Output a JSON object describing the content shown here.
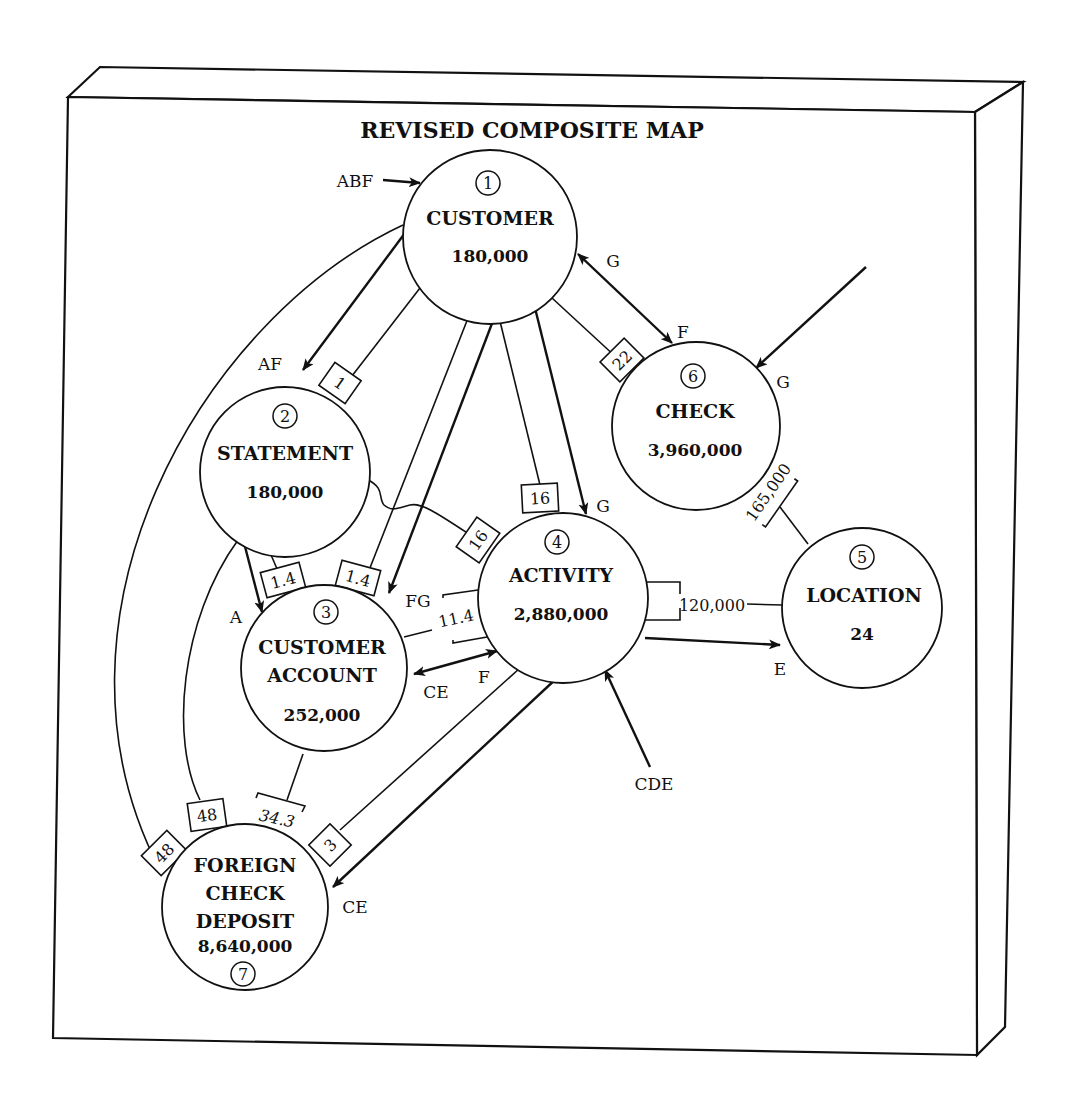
{
  "title": "REVISED COMPOSITE MAP",
  "nodes": [
    {
      "id": 1,
      "num": "1",
      "name": "CUSTOMER",
      "volume": "180,000"
    },
    {
      "id": 2,
      "num": "2",
      "name": "STATEMENT",
      "volume": "180,000"
    },
    {
      "id": 3,
      "num": "3",
      "name_line1": "CUSTOMER",
      "name_line2": "ACCOUNT",
      "volume": "252,000"
    },
    {
      "id": 4,
      "num": "4",
      "name": "ACTIVITY",
      "volume": "2,880,000"
    },
    {
      "id": 5,
      "num": "5",
      "name": "LOCATION",
      "volume": "24"
    },
    {
      "id": 6,
      "num": "6",
      "name": "CHECK",
      "volume": "3,960,000"
    },
    {
      "id": 7,
      "num": "7",
      "name_line1": "FOREIGN",
      "name_line2": "CHECK",
      "name_line3": "DEPOSIT",
      "volume": "8,640,000"
    }
  ],
  "ratios": {
    "customer_statement": "1",
    "customer_check": "22",
    "customer_activity": "16",
    "statement_activity": "16",
    "statement_account": "1.4",
    "customer_account": "1.4",
    "account_activity": "11.4",
    "check_location": "165,000",
    "activity_location": "120,000",
    "customer_fcd": "48",
    "statement_fcd": "48",
    "account_fcd": "34.3",
    "activity_fcd": "3"
  },
  "access_labels": {
    "customer_entry": "ABF",
    "customer_from_check": "G",
    "check_from_customer": "F",
    "check_entry": "G",
    "statement_entry": "AF",
    "activity_from_customer": "G",
    "account_from_statement": "A",
    "account_from_customer": "FG",
    "account_from_activity": "CE",
    "activity_from_account": "F",
    "location_from_activity": "E",
    "activity_entry": "CDE",
    "fcd_from_activity": "CE"
  }
}
